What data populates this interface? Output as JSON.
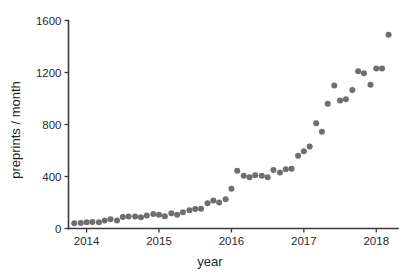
{
  "chart_data": {
    "type": "scatter",
    "title": "",
    "xlabel": "year",
    "ylabel": "preprints / month",
    "xlim": [
      2013.75,
      2018.3
    ],
    "ylim": [
      0,
      1600
    ],
    "xticks": [
      2014,
      2015,
      2016,
      2017,
      2018
    ],
    "xticklabels": [
      "2014",
      "2015",
      "2016",
      "2017",
      "2018"
    ],
    "yticks": [
      0,
      400,
      800,
      1200,
      1600
    ],
    "yticklabels": [
      "0",
      "400",
      "800",
      "1200",
      "1600"
    ],
    "grid": false,
    "legend": null,
    "marker_color": "#6e6e6e",
    "marker_size": 3.0,
    "series": [
      {
        "name": "preprints per month",
        "x": [
          2013.83,
          2013.92,
          2014.0,
          2014.08,
          2014.17,
          2014.25,
          2014.33,
          2014.42,
          2014.5,
          2014.58,
          2014.67,
          2014.75,
          2014.83,
          2014.92,
          2015.0,
          2015.08,
          2015.17,
          2015.25,
          2015.33,
          2015.42,
          2015.5,
          2015.58,
          2015.67,
          2015.75,
          2015.83,
          2015.92,
          2016.0,
          2016.08,
          2016.17,
          2016.25,
          2016.33,
          2016.42,
          2016.5,
          2016.58,
          2016.67,
          2016.75,
          2016.83,
          2016.92,
          2017.0,
          2017.08,
          2017.17,
          2017.25,
          2017.33,
          2017.42,
          2017.5,
          2017.58,
          2017.67,
          2017.75,
          2017.83,
          2017.92,
          2018.0,
          2018.08,
          2018.17
        ],
        "y": [
          40,
          42,
          48,
          50,
          48,
          62,
          72,
          62,
          88,
          92,
          92,
          86,
          100,
          112,
          105,
          95,
          118,
          105,
          125,
          140,
          150,
          152,
          195,
          215,
          200,
          225,
          305,
          445,
          405,
          395,
          410,
          405,
          395,
          450,
          430,
          455,
          460,
          560,
          595,
          630,
          810,
          745,
          960,
          1100,
          985,
          995,
          1065,
          1210,
          1195,
          1105,
          1230,
          1230,
          1490
        ]
      }
    ]
  }
}
